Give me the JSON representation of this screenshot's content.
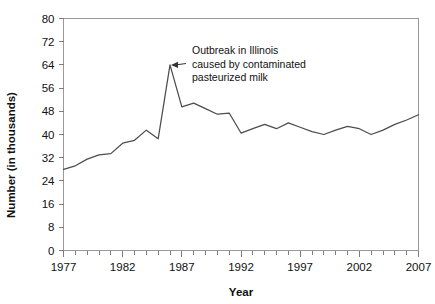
{
  "chart_data": {
    "type": "line",
    "title": "",
    "xlabel": "Year",
    "ylabel": "Number (in thousands)",
    "xlim": [
      1977,
      2007
    ],
    "ylim": [
      0,
      80
    ],
    "grid": false,
    "legend": false,
    "x_tick_labels": [
      "1977",
      "1982",
      "1987",
      "1992",
      "1997",
      "2002",
      "2007"
    ],
    "x_tick_values": [
      1977,
      1982,
      1987,
      1992,
      1997,
      2002,
      2007
    ],
    "x_minor_tick_interval": 1,
    "y_tick_labels": [
      "0",
      "8",
      "16",
      "24",
      "32",
      "40",
      "48",
      "56",
      "64",
      "72",
      "80"
    ],
    "y_tick_values": [
      0,
      8,
      16,
      24,
      32,
      40,
      48,
      56,
      64,
      72,
      80
    ],
    "x": [
      1977,
      1978,
      1979,
      1980,
      1981,
      1982,
      1983,
      1984,
      1985,
      1986,
      1987,
      1988,
      1989,
      1990,
      1991,
      1992,
      1993,
      1994,
      1995,
      1996,
      1997,
      1998,
      1999,
      2000,
      2001,
      2002,
      2003,
      2004,
      2005,
      2006,
      2007
    ],
    "values": [
      28.0,
      29.2,
      31.5,
      33.0,
      33.4,
      37.0,
      38.0,
      41.5,
      38.5,
      64.0,
      49.5,
      50.8,
      48.9,
      47.0,
      47.4,
      40.5,
      42.0,
      43.5,
      42.0,
      44.0,
      42.5,
      41.0,
      40.0,
      41.5,
      42.8,
      42.0,
      40.0,
      41.5,
      43.5,
      45.0,
      46.8
    ],
    "series_name": "Salmonellosis cases",
    "annotations": [
      {
        "id": "outbreak",
        "lines": [
          "Outbreak in Illinois",
          "caused by contaminated",
          "pasteurized milk"
        ],
        "target_x": 1986,
        "target_y": 64,
        "arrow": true
      }
    ],
    "colors": {
      "line": "#4d4d4d",
      "frame": "#9a9a9a",
      "text": "#111111",
      "background": "#ffffff"
    }
  }
}
